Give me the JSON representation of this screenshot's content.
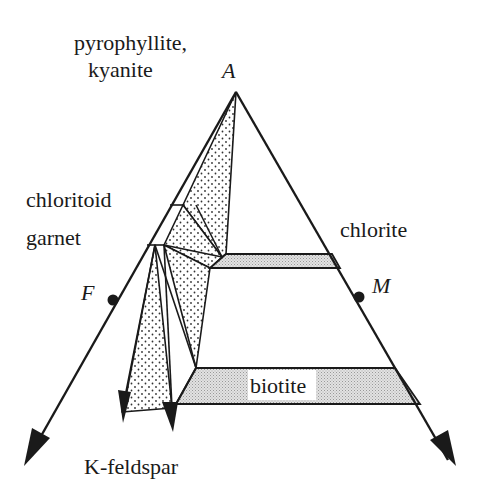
{
  "diagram": {
    "vertices": {
      "apex": {
        "label": "A"
      },
      "left": {
        "label": "F"
      },
      "right": {
        "label": "M"
      }
    },
    "labels": {
      "pyrophyllite": "pyrophyllite,",
      "kyanite": "kyanite",
      "chloritoid": "chloritoid",
      "garnet": "garnet",
      "chlorite": "chlorite",
      "biotite": "biotite",
      "kfeldspar": "K-feldspar"
    },
    "colors": {
      "line": "#1a1a1a",
      "band_fill": "#d4d4d4",
      "dots": "#333333",
      "background": "#ffffff"
    }
  }
}
